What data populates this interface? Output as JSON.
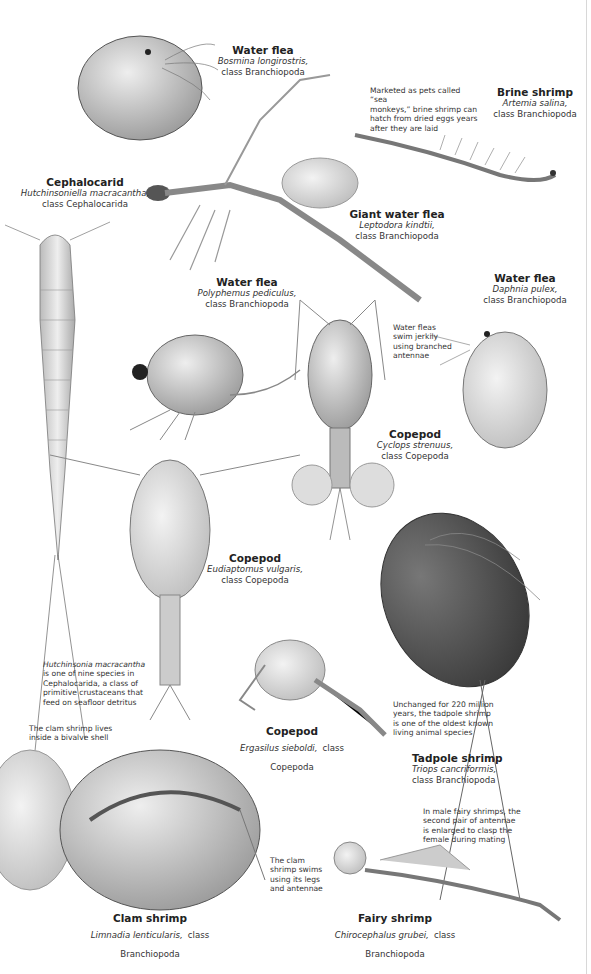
{
  "species": [
    {
      "id": "bosmina",
      "common": "Water flea",
      "scientific": "Bosmina longirostris,",
      "class": "class Branchiopoda"
    },
    {
      "id": "artemia",
      "common": "Brine shrimp",
      "scientific": "Artemia salina,",
      "class": "class Branchiopoda"
    },
    {
      "id": "cephalocarid",
      "common": "Cephalocarid",
      "scientific": "Hutchinsoniella macracantha,",
      "class": "class Cephalocarida"
    },
    {
      "id": "leptodora",
      "common": "Giant water flea",
      "scientific": "Leptodora kindtii,",
      "class": "class Branchiopoda"
    },
    {
      "id": "polyphemus",
      "common": "Water flea",
      "scientific": "Polyphemus pediculus,",
      "class": "class Branchiopoda"
    },
    {
      "id": "daphnia",
      "common": "Water flea",
      "scientific": "Daphnia pulex,",
      "class": "class Branchiopoda"
    },
    {
      "id": "cyclops",
      "common": "Copepod",
      "scientific": "Cyclops strenuus,",
      "class": "class Copepoda"
    },
    {
      "id": "eudiaptomus",
      "common": "Copepod",
      "scientific": "Eudiaptomus vulgaris,",
      "class": "class Copepoda"
    },
    {
      "id": "ergasilus",
      "common": "Copepod",
      "scientific": "Ergasilus sieboldi,",
      "class": "class Copepoda"
    },
    {
      "id": "triops",
      "common": "Tadpole shrimp",
      "scientific": "Triops cancriformis,",
      "class": "class Branchiopoda"
    },
    {
      "id": "limnadia",
      "common": "Clam shrimp",
      "scientific": "Limnadia lenticularis,",
      "class": "class Branchiopoda"
    },
    {
      "id": "chirocephalus",
      "common": "Fairy shrimp",
      "scientific": "Chirocephalus grubei,",
      "class": "class Branchiopoda"
    }
  ],
  "notes": {
    "sea_monkeys": [
      "Marketed as pets called “sea",
      "monkeys,” brine shrimp can",
      "hatch from dried eggs years",
      "after they are laid"
    ],
    "water_fleas_swim": [
      "Water fleas",
      "swim jerkily",
      "using branched",
      "antennae"
    ],
    "hutchinsonia_italic": "Hutchinsonia macracantha",
    "hutchinsonia_rest": [
      "is one of nine species in",
      "Cephalocarida, a class of",
      "primitive crustaceans that",
      "feed on seafloor detritus"
    ],
    "clam_shell": [
      "The clam shrimp lives",
      "inside a bivalve shell"
    ],
    "tadpole_age": [
      "Unchanged for 220 million",
      "years, the tadpole shrimp",
      "is one of the oldest known",
      "living animal species"
    ],
    "fairy_antennae": [
      "In male fairy shrimps, the",
      "second pair of antennae",
      "is enlarged to clasp the",
      "female during mating"
    ],
    "clam_swims": [
      "The clam",
      "shrimp swims",
      "using its legs",
      "and antennae"
    ]
  },
  "colors": {
    "ink": "#2a2a2a",
    "illustration_gray": "#8a8a8a",
    "shadow": "#555555",
    "page": "#ffffff"
  }
}
